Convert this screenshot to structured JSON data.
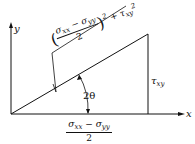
{
  "diagram": {
    "axes": {
      "x_label": "x",
      "y_label": "y"
    },
    "angle_label": "2θ",
    "vertical_side_label": {
      "symbol": "τ",
      "subscript": "xy"
    },
    "horizontal_side_label": {
      "numerator_a": "σ",
      "numerator_a_sub": "xx",
      "minus": "−",
      "numerator_b": "σ",
      "numerator_b_sub": "yy",
      "denominator": "2"
    },
    "hypotenuse_label": {
      "radical": "√",
      "numerator_a": "σ",
      "numerator_a_sub": "xx",
      "minus": "−",
      "numerator_b": "σ",
      "numerator_b_sub": "yy",
      "denominator": "2",
      "power": "2",
      "plus": "+",
      "tau": "τ",
      "tau_sub": "xy",
      "tau_power": "2"
    }
  }
}
